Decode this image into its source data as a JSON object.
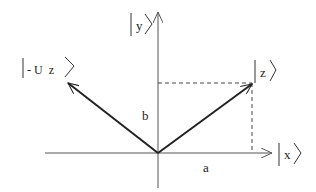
{
  "diagram": {
    "labels": {
      "y_axis": "y",
      "x_axis": "x",
      "z_vec": "z",
      "neg_vec": "- U  z",
      "a": "a",
      "b": "b"
    },
    "colors": {
      "axis": "#555555",
      "vector": "#222222",
      "dashed": "#444444"
    }
  }
}
